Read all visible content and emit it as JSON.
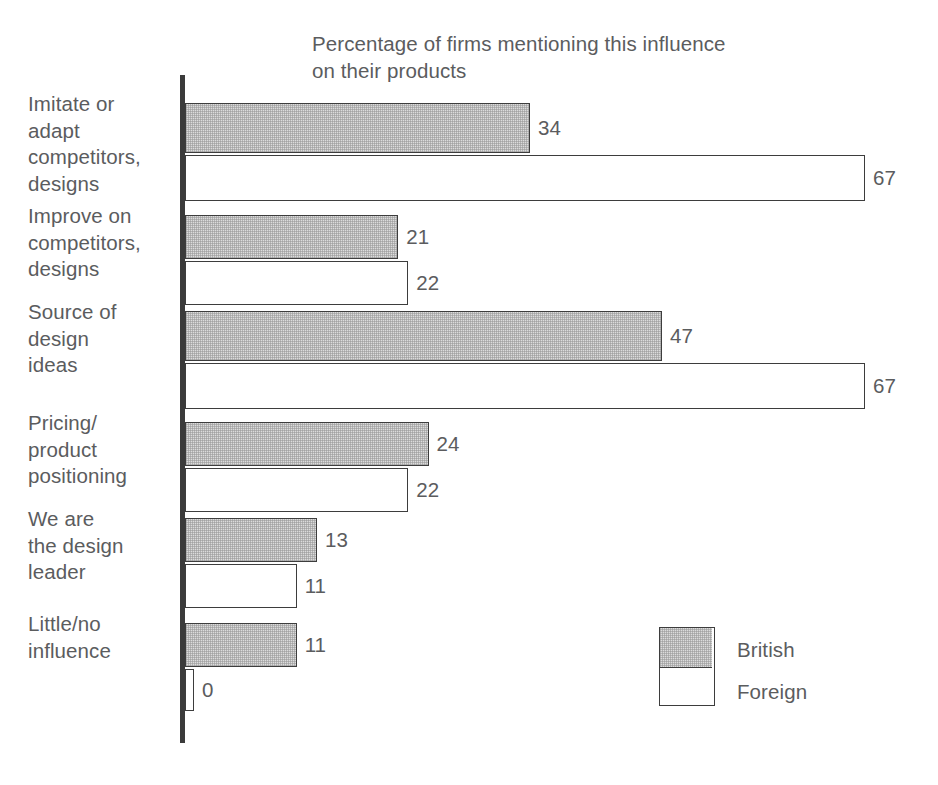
{
  "chart_data": {
    "type": "bar",
    "orientation": "horizontal",
    "title": "Percentage of firms mentioning this influence\non their products",
    "xlabel": "",
    "ylabel": "",
    "xlim": [
      0,
      72
    ],
    "grid": false,
    "legend_position": "bottom-right",
    "categories": [
      "Imitate or\nadapt\ncompetitors,\ndesigns",
      "Improve on\ncompetitors,\ndesigns",
      "Source of\ndesign\nideas",
      "Pricing/\nproduct\npositioning",
      "We are\nthe design\nleader",
      "Little/no\ninfluence"
    ],
    "series": [
      {
        "name": "British",
        "color": "#dcdcdc",
        "values": [
          34,
          21,
          47,
          24,
          13,
          11
        ]
      },
      {
        "name": "Foreign",
        "color": "#ffffff",
        "values": [
          67,
          22,
          67,
          22,
          11,
          0
        ]
      }
    ],
    "value_labels": {
      "british": [
        "34",
        "21",
        "47",
        "24",
        "13",
        "11"
      ],
      "foreign": [
        "67",
        "22",
        "67",
        "22",
        "11",
        "0"
      ]
    }
  },
  "legend": {
    "items": [
      {
        "label": "British"
      },
      {
        "label": "Foreign"
      }
    ]
  },
  "colors": {
    "bar_outline": "#3d3d3d",
    "axis": "#3b3b3b",
    "text": "#5b5c5e",
    "british_fill": "#dcdcdc",
    "foreign_fill": "#ffffff",
    "background": "#ffffff"
  }
}
